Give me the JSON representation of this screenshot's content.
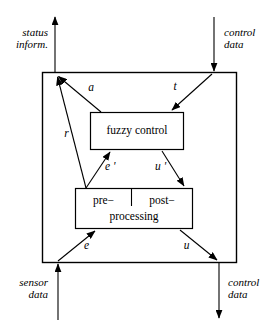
{
  "figure": {
    "type": "block-diagram",
    "stroke_color": "#000000",
    "background_color": "#ffffff"
  },
  "outer_block": {
    "name": "fuzzy controller boundary"
  },
  "blocks": [
    {
      "id": "fuzzy-control",
      "label": "fuzzy control"
    },
    {
      "id": "processing",
      "label_left": "pre−",
      "label_right": "post−",
      "label_bottom": "processing"
    }
  ],
  "io_labels": {
    "status_information": "status\ninform.",
    "control_data_top": "control\ndata",
    "sensor_data": "sensor\ndata",
    "control_data_bottom": "control\ndata"
  },
  "signal_labels": {
    "a": "a",
    "t": "t",
    "r": "r",
    "e_prime": "e '",
    "u_prime": "u '",
    "e": "e",
    "u": "u"
  }
}
